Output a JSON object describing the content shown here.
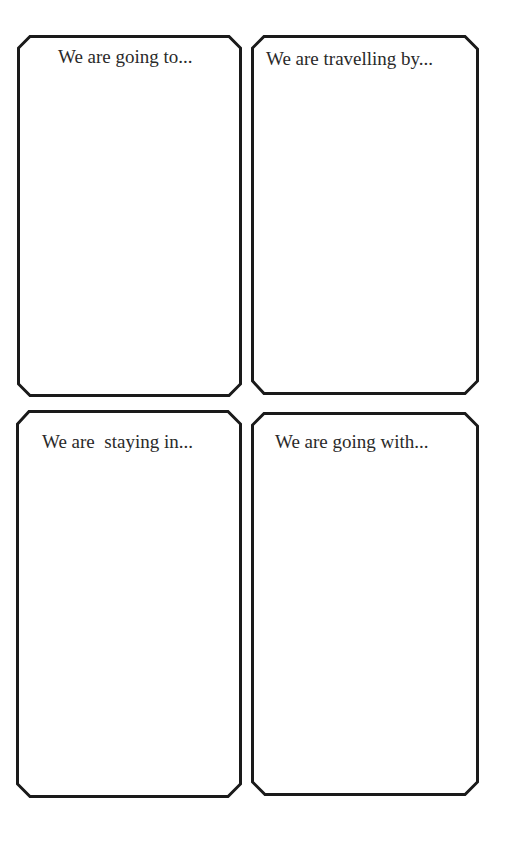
{
  "worksheet": {
    "cards": [
      {
        "id": "destination",
        "prompt": "We are going to..."
      },
      {
        "id": "transport",
        "prompt": "We are travelling by..."
      },
      {
        "id": "accommodation",
        "prompt": "We are  staying in..."
      },
      {
        "id": "companions",
        "prompt": "We are going with..."
      }
    ]
  },
  "style": {
    "border_color": "#1a1a1a",
    "text_color": "#2a2a2a",
    "background": "#ffffff"
  }
}
